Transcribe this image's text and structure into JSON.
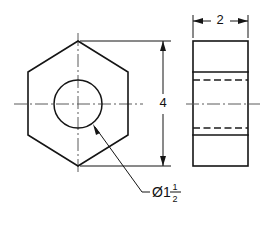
{
  "drawing": {
    "title": "Hex Nut Two-View Orthographic Drawing",
    "background_color": "#ffffff",
    "line_color": "#151515",
    "centerline_color": "#5a5a5a",
    "views": {
      "front": {
        "name": "front-view-hexagon",
        "shape": "hexagon",
        "hole": "circle"
      },
      "side": {
        "name": "side-view-rectangle",
        "shape": "rectangle",
        "hidden_lines": 2,
        "visible_edges": 2
      }
    },
    "dimensions": [
      {
        "id": "width-dim",
        "value": "2",
        "orientation": "horizontal",
        "location": "top"
      },
      {
        "id": "height-dim",
        "value": "4",
        "orientation": "vertical",
        "location": "middle"
      }
    ],
    "notes": {
      "hole_diameter": {
        "symbol": "Ø",
        "whole": "1",
        "numerator": "1",
        "denominator": "2",
        "full_text": "Ø1 1/2"
      }
    }
  }
}
